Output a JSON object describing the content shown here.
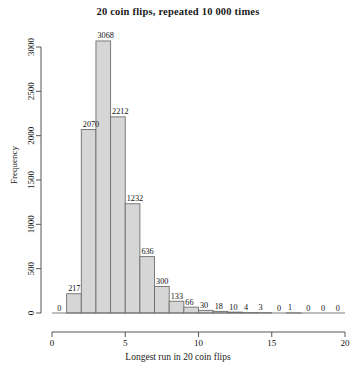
{
  "chart_data": {
    "type": "bar",
    "title": "20 coin flips, repeated 10 000 times",
    "xlabel": "Longest run in 20 coin flips",
    "ylabel": "Frequency",
    "categories": [
      1,
      2,
      3,
      4,
      5,
      6,
      7,
      8,
      9,
      10,
      11,
      12,
      13,
      14,
      15,
      16,
      17,
      18,
      19,
      20
    ],
    "values": [
      0,
      217,
      2070,
      3068,
      2212,
      1232,
      636,
      300,
      133,
      66,
      30,
      18,
      10,
      4,
      3,
      0,
      1,
      0,
      0,
      0
    ],
    "bar_labels": [
      "0",
      "217",
      "2070",
      "3068",
      "2212",
      "1232",
      "636",
      "300",
      "133",
      "66",
      "30",
      "18",
      "10",
      "4",
      "3",
      "0",
      "1",
      "0",
      "0",
      "0"
    ],
    "xticks": [
      0,
      5,
      10,
      15,
      20
    ],
    "xtick_labels": [
      "0",
      "5",
      "10",
      "15",
      "20"
    ],
    "yticks": [
      0,
      500,
      1000,
      1500,
      2000,
      2500,
      3000
    ],
    "ytick_labels": [
      "0",
      "500",
      "1000",
      "1500",
      "2000",
      "2500",
      "3000"
    ],
    "xlim": [
      0,
      20
    ],
    "ylim": [
      0,
      3100
    ],
    "grid": false,
    "legend": null,
    "bar_fill": "#d6d6d6",
    "bar_edge": "#6e6e6e",
    "axis_color": "#555555"
  }
}
